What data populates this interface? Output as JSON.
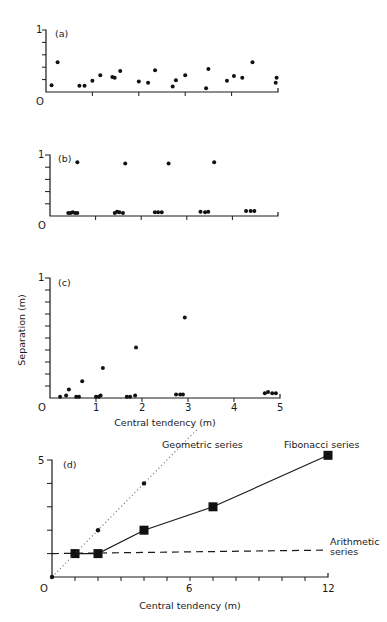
{
  "caption": "",
  "chart_data": [
    {
      "panel": "(a)",
      "type": "scatter",
      "xlabel": "",
      "ylabel": "",
      "xlim": [
        0,
        5
      ],
      "ylim": [
        0,
        1
      ],
      "y_tick_labels": {
        "top": "1",
        "origin": "0"
      },
      "points": [
        [
          0.12,
          0.11
        ],
        [
          0.25,
          0.48
        ],
        [
          0.72,
          0.1
        ],
        [
          0.83,
          0.1
        ],
        [
          1.0,
          0.18
        ],
        [
          1.17,
          0.27
        ],
        [
          1.43,
          0.24
        ],
        [
          1.48,
          0.23
        ],
        [
          1.6,
          0.34
        ],
        [
          2.0,
          0.17
        ],
        [
          2.2,
          0.15
        ],
        [
          2.35,
          0.35
        ],
        [
          2.73,
          0.09
        ],
        [
          2.8,
          0.19
        ],
        [
          3.0,
          0.27
        ],
        [
          3.45,
          0.06
        ],
        [
          3.5,
          0.37
        ],
        [
          3.9,
          0.18
        ],
        [
          4.05,
          0.26
        ],
        [
          4.23,
          0.23
        ],
        [
          4.45,
          0.48
        ],
        [
          4.95,
          0.15
        ],
        [
          4.97,
          0.23
        ]
      ]
    },
    {
      "panel": "(b)",
      "type": "scatter",
      "xlim": [
        0,
        5
      ],
      "ylim": [
        0,
        1
      ],
      "y_tick_labels": {
        "top": "1",
        "origin": "0"
      },
      "points": [
        [
          0.4,
          0.05
        ],
        [
          0.45,
          0.05
        ],
        [
          0.5,
          0.06
        ],
        [
          0.55,
          0.05
        ],
        [
          0.6,
          0.05
        ],
        [
          0.6,
          0.88
        ],
        [
          1.42,
          0.05
        ],
        [
          1.47,
          0.07
        ],
        [
          1.52,
          0.06
        ],
        [
          1.6,
          0.05
        ],
        [
          1.65,
          0.86
        ],
        [
          2.3,
          0.06
        ],
        [
          2.37,
          0.06
        ],
        [
          2.45,
          0.06
        ],
        [
          2.6,
          0.86
        ],
        [
          3.3,
          0.07
        ],
        [
          3.4,
          0.06
        ],
        [
          3.47,
          0.07
        ],
        [
          3.6,
          0.88
        ],
        [
          4.3,
          0.08
        ],
        [
          4.4,
          0.08
        ],
        [
          4.48,
          0.08
        ]
      ]
    },
    {
      "panel": "(c)",
      "type": "scatter",
      "xlabel": "Central tendency (m)",
      "ylabel": "Separation (m)",
      "xlim": [
        0,
        5
      ],
      "ylim": [
        0,
        1
      ],
      "x_ticks": [
        "0",
        "1",
        "2",
        "3",
        "4",
        "5"
      ],
      "y_tick_labels": {
        "top": "1"
      },
      "points": [
        [
          0.22,
          0.01
        ],
        [
          0.35,
          0.02
        ],
        [
          0.41,
          0.07
        ],
        [
          0.57,
          0.01
        ],
        [
          0.63,
          0.01
        ],
        [
          0.7,
          0.14
        ],
        [
          1.0,
          0.01
        ],
        [
          1.06,
          0.01
        ],
        [
          1.1,
          0.02
        ],
        [
          1.15,
          0.25
        ],
        [
          1.67,
          0.01
        ],
        [
          1.74,
          0.01
        ],
        [
          1.85,
          0.02
        ],
        [
          1.87,
          0.42
        ],
        [
          2.74,
          0.03
        ],
        [
          2.83,
          0.03
        ],
        [
          2.89,
          0.03
        ],
        [
          2.93,
          0.67
        ],
        [
          4.67,
          0.04
        ],
        [
          4.74,
          0.05
        ],
        [
          4.83,
          0.04
        ],
        [
          4.91,
          0.04
        ]
      ]
    },
    {
      "panel": "(d)",
      "type": "line",
      "xlabel": "Central tendency (m)",
      "ylabel": "",
      "xlim": [
        0,
        12
      ],
      "ylim": [
        0,
        5
      ],
      "x_ticks": [
        "0",
        "6",
        "12"
      ],
      "y_tick_labels": {
        "top": "5"
      },
      "series": [
        {
          "name": "Fibonacci series",
          "style": "solid",
          "marker": "square",
          "x": [
            1,
            2,
            4,
            7,
            12
          ],
          "y": [
            1,
            1,
            2,
            3,
            5.2
          ]
        },
        {
          "name": "Geometric series",
          "style": "dotted",
          "marker": "dot",
          "x": [
            0,
            1,
            2,
            4
          ],
          "y": [
            0,
            1,
            2,
            4
          ],
          "line_extends_to": [
            6.3,
            6.3
          ]
        },
        {
          "name": "Arithmetic series",
          "style": "dashed",
          "marker": "none",
          "x": [
            0,
            12
          ],
          "y": [
            1,
            1.15
          ]
        }
      ],
      "annotations": [
        "Geometric series",
        "Fibonacci series",
        "Arithmetic",
        "series"
      ]
    }
  ],
  "labels": {
    "a": "(a)",
    "b": "(b)",
    "c": "(c)",
    "d": "(d)",
    "one": "1",
    "zero": "O",
    "five": "5",
    "c_x": [
      "1",
      "2",
      "3",
      "4",
      "5"
    ],
    "d_x6": "6",
    "d_x12": "12",
    "xlabel": "Central tendency (m)",
    "ylabel": "Separation (m)",
    "geo": "Geometric series",
    "fib": "Fibonacci series",
    "arith1": "Arithmetic",
    "arith2": "series"
  }
}
